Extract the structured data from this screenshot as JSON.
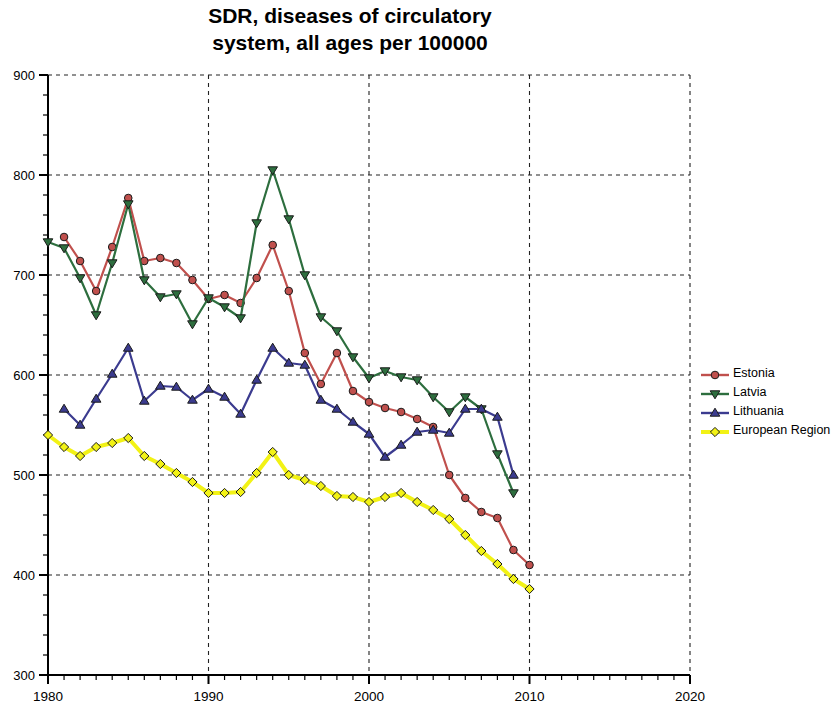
{
  "chart_data": {
    "type": "line",
    "title": "SDR, diseases of circulatory\nsystem, all ages per 100000",
    "xlabel": "",
    "ylabel": "",
    "xlim": [
      1980,
      2020
    ],
    "ylim": [
      300,
      900
    ],
    "x_ticks": [
      "1980",
      "1990",
      "2000",
      "2010",
      "2020"
    ],
    "x_tick_values": [
      1980,
      1990,
      2000,
      2010,
      2020
    ],
    "y_ticks": [
      "300",
      "400",
      "500",
      "600",
      "700",
      "800",
      "900"
    ],
    "y_tick_values": [
      300,
      400,
      500,
      600,
      700,
      800,
      900
    ],
    "x_minor_step": 1,
    "y_minor_step": 20,
    "grid": "dashed",
    "legend_position": "right",
    "series": [
      {
        "name": "Estonia",
        "color": "#c0504d",
        "marker": "circle",
        "x": [
          1981,
          1982,
          1983,
          1984,
          1985,
          1986,
          1987,
          1988,
          1989,
          1990,
          1991,
          1992,
          1993,
          1994,
          1995,
          1996,
          1997,
          1998,
          1999,
          2000,
          2001,
          2002,
          2003,
          2004,
          2005,
          2006,
          2007,
          2008,
          2009,
          2010
        ],
        "values": [
          738,
          714,
          684,
          728,
          777,
          714,
          717,
          712,
          695,
          676,
          680,
          672,
          697,
          730,
          684,
          622,
          591,
          622,
          584,
          573,
          567,
          563,
          556,
          548,
          500,
          477,
          463,
          457,
          425,
          410
        ]
      },
      {
        "name": "Latvia",
        "color": "#2d6e3e",
        "marker": "triangle-down",
        "x": [
          1980,
          1981,
          1982,
          1983,
          1984,
          1985,
          1986,
          1987,
          1988,
          1989,
          1990,
          1991,
          1992,
          1993,
          1994,
          1995,
          1996,
          1997,
          1998,
          1999,
          2000,
          2001,
          2002,
          2003,
          2004,
          2005,
          2006,
          2007,
          2008,
          2009
        ],
        "values": [
          733,
          727,
          697,
          660,
          712,
          771,
          695,
          678,
          681,
          651,
          677,
          668,
          657,
          752,
          805,
          756,
          700,
          658,
          644,
          618,
          597,
          604,
          598,
          595,
          578,
          563,
          578,
          566,
          521,
          482
        ]
      },
      {
        "name": "Lithuania",
        "color": "#3b3b8f",
        "marker": "triangle-up",
        "x": [
          1981,
          1982,
          1983,
          1984,
          1985,
          1986,
          1987,
          1988,
          1989,
          1990,
          1991,
          1992,
          1993,
          1994,
          1995,
          1996,
          1997,
          1998,
          1999,
          2000,
          2001,
          2002,
          2003,
          2004,
          2005,
          2006,
          2007,
          2008,
          2009
        ],
        "values": [
          566,
          550,
          576,
          601,
          627,
          574,
          589,
          588,
          575,
          586,
          578,
          561,
          595,
          627,
          612,
          610,
          575,
          566,
          553,
          541,
          518,
          530,
          543,
          545,
          542,
          566,
          566,
          558,
          500
        ]
      },
      {
        "name": "European Region",
        "color": "#f2f215",
        "marker": "diamond",
        "x": [
          1980,
          1981,
          1982,
          1983,
          1984,
          1985,
          1986,
          1987,
          1988,
          1989,
          1990,
          1991,
          1992,
          1993,
          1994,
          1995,
          1996,
          1997,
          1998,
          1999,
          2000,
          2001,
          2002,
          2003,
          2004,
          2005,
          2006,
          2007,
          2008,
          2009,
          2010
        ],
        "values": [
          540,
          528,
          519,
          528,
          532,
          537,
          519,
          511,
          502,
          493,
          482,
          482,
          483,
          502,
          523,
          500,
          495,
          489,
          479,
          478,
          473,
          478,
          482,
          473,
          465,
          456,
          440,
          424,
          411,
          396,
          386
        ]
      }
    ]
  },
  "legend": {
    "items": [
      {
        "label": "Estonia",
        "color": "#c0504d",
        "marker": "circle"
      },
      {
        "label": "Latvia",
        "color": "#2d6e3e",
        "marker": "triangle-down"
      },
      {
        "label": "Lithuania",
        "color": "#3b3b8f",
        "marker": "triangle-up"
      },
      {
        "label": "European Region",
        "color": "#f2f215",
        "marker": "diamond"
      }
    ]
  }
}
